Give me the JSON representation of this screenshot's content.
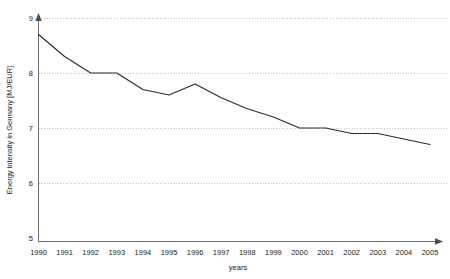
{
  "chart_data": {
    "type": "line",
    "title": "",
    "subtitle": "",
    "xlabel": "years",
    "ylabel": "Energy intensity in Germany [MJ/EUR]",
    "categories": [
      "1990",
      "1991",
      "1992",
      "1993",
      "1994",
      "1995",
      "1996",
      "1997",
      "1998",
      "1999",
      "2000",
      "2001",
      "2002",
      "2003",
      "2004",
      "2005"
    ],
    "x": [
      1990,
      1991,
      1992,
      1993,
      1994,
      1995,
      1996,
      1997,
      1998,
      1999,
      2000,
      2001,
      2002,
      2003,
      2004,
      2005
    ],
    "values": [
      8.7,
      8.3,
      8.0,
      8.0,
      7.7,
      7.6,
      7.8,
      7.55,
      7.35,
      7.2,
      7.0,
      7.0,
      6.9,
      6.9,
      6.8,
      6.7
    ],
    "series": [
      {
        "name": "Energy intensity in Germany",
        "values": [
          8.7,
          8.3,
          8.0,
          8.0,
          7.7,
          7.6,
          7.8,
          7.55,
          7.35,
          7.2,
          7.0,
          7.0,
          6.9,
          6.9,
          6.8,
          6.7
        ]
      }
    ],
    "ylim": [
      5,
      9
    ],
    "xlim": [
      1990,
      2005
    ],
    "yticks": [
      5,
      6,
      7,
      8,
      9
    ],
    "ytick_labels": [
      "5",
      "6",
      "7",
      "8",
      "9"
    ],
    "xtick_labels": [
      "1990",
      "1991",
      "1992",
      "1993",
      "1994",
      "1995",
      "1996",
      "1997",
      "1998",
      "1999",
      "2000",
      "2001",
      "2002",
      "2003",
      "2004",
      "2005"
    ],
    "grid": "horizontal-dotted",
    "legend": "none",
    "line_color": "#2b2b2b",
    "grid_color": "#9a9a9a",
    "axis_color": "#6f6f6f",
    "background_color": "#ffffff",
    "annotations": []
  }
}
